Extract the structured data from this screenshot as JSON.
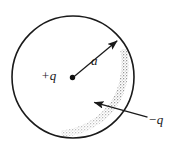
{
  "figure": {
    "background_color": "#ffffff",
    "stroke_color": "#1a1a1a",
    "stipple_color": "#8c8c8c"
  },
  "labels": {
    "center_charge": "+q",
    "radius": "a",
    "patch_charge": "−q"
  },
  "geometry": {
    "circle": {
      "cx": 73,
      "cy": 77,
      "r": 61,
      "stroke_width": 1.6
    },
    "center_dot": {
      "cx": 72.5,
      "cy": 77.5,
      "r": 2.6
    },
    "radius_arrow": {
      "x1": 73,
      "y1": 77,
      "x2": 118,
      "y2": 40
    },
    "leader_arrow": {
      "x1": 148,
      "y1": 117,
      "x2": 93,
      "y2": 102
    },
    "stipple_band": {
      "description": "crescent-shaped stippled patch hugging the inner lower-right edge of the circle",
      "start_angle_deg": -28,
      "end_angle_deg": 100
    }
  },
  "icons": {
    "arrowhead": "arrowhead-icon",
    "point_charge": "point-charge-dot-icon"
  }
}
